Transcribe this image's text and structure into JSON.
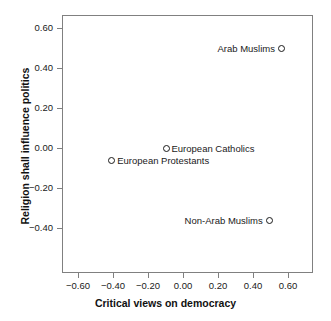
{
  "chart_data": {
    "type": "scatter",
    "title": "",
    "xlabel": "Critical views on democracy",
    "ylabel": "Religion shall influence politics",
    "xlim": [
      -0.72,
      0.72
    ],
    "ylim": [
      -0.475,
      0.665
    ],
    "grid": false,
    "legend": "none",
    "xticks": [
      -0.6,
      -0.4,
      -0.2,
      0.0,
      0.2,
      0.4,
      0.6
    ],
    "xticklabels": [
      "-0.60",
      "-0.40",
      "-0.20",
      "0.00",
      "0.20",
      "0.40",
      "0.60"
    ],
    "yticks": [
      0.6,
      0.4,
      0.2,
      0.0,
      -0.2,
      -0.4
    ],
    "yticklabels": [
      "0.60",
      "0.40",
      "0.20",
      "0.00",
      "-0.20",
      "-0.40"
    ],
    "marker": "open-circle",
    "marker_color": "#1a1a1a",
    "points": [
      {
        "label": "Arab Muslims",
        "x": 0.56,
        "y": 0.5,
        "label_side": "left"
      },
      {
        "label": "European Catholics",
        "x": -0.1,
        "y": 0.0,
        "label_side": "right"
      },
      {
        "label": "European Protestants",
        "x": -0.41,
        "y": -0.06,
        "label_side": "right"
      },
      {
        "label": "Non-Arab Muslims",
        "x": 0.49,
        "y": -0.36,
        "label_side": "left"
      }
    ]
  },
  "colors": {
    "frame": "#808080",
    "text": "#1a1a1a",
    "background": "#ffffff"
  }
}
